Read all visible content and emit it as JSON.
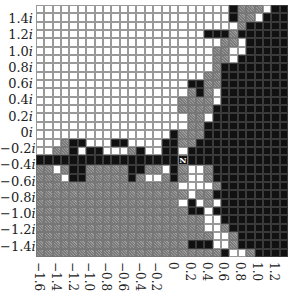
{
  "chart_data": {
    "type": "heatmap",
    "title": "",
    "xlabel": "",
    "ylabel": "",
    "x_ticks": [
      "-1.6",
      "-1.4",
      "-1.2",
      "-1.0",
      "-0.8",
      "-0.6",
      "-0.4",
      "-0.2",
      "0",
      "0.2",
      "0.4",
      "0.6",
      "0.8",
      "1.0",
      "1.2"
    ],
    "y_ticks": [
      "1.4i",
      "1.2i",
      "1.0i",
      "0.8i",
      "0.6i",
      "0.4i",
      "0.2i",
      "0i",
      "-0.2i",
      "-0.4i",
      "-0.6i",
      "-0.8i",
      "-1.0i",
      "-1.2i",
      "-1.4i"
    ],
    "xlim": [
      -1.6,
      1.4
    ],
    "ylim": [
      -1.5,
      1.5
    ],
    "grid": true,
    "legend": {
      "W": "white cell",
      "G": "gray (checkered) cell",
      "B": "black cell",
      "N": "marker cell labeled N"
    },
    "marker_label": "N",
    "rows": [
      "WWWWWWWWWWWWWWWWWWWWWWWBGGGWBB",
      "WWWWWWWWWWWWWWWWWWWWWWWBGGWBBB",
      "WWWWWWWWWWWWWWWWWWWWWWWWGBBBBB",
      "WWWWWWWWWWWWWWWWWWWWBBBGBBBBBB",
      "WWWWWWWWWWWWWWWWWWWWWWGGWBBBBB",
      "WWWWWWWWWWWWWWWWWWWWWGGWWBBBBB",
      "WWWWWWWWWWWWWWWWWWWWWGGWBBBBBB",
      "WWWWWWWWWWWWWWWWWWWWWGBBBBBBBB",
      "WWWWWWWWWWWWWWWWWWWWGGBBBBBBBB",
      "WWWWWWWWWWWWWWWWWWBBGGBBBBBBBB",
      "WWWWWWWWWWWWWWWWWWGBGWBBBBBBBB",
      "WWWWWWWWWWWWWWWWWGGGGWBBBBBBBB",
      "WWWWWWWWWWWWWWWWWGGGGBBBBBBBBB",
      "WWWWWWWWWWWWWWWWWWGGWBBBBBBBBB",
      "WWWWWWWWWWWWWWWWWWGGBBBBBBBBBB",
      "WWWWWWWWWWWWWWWWBGGGBBBBBBBBBB",
      "WWWGBBWWWBBWWWWBBGGBBBBBBBBBBB",
      "WWGGBWBBWWWGBWWBBWBBBBBBBBBBBB",
      "BBBBBBBBBBBBBBBBBNBBBBBBBBBBBB",
      "GGWGBBGGGGGBBGGWBGWWGBBBBBBBBB",
      "GGGWBBGGGGGBGWWGBGWWGBBBBBBBBB",
      "GGGGGGGGGGGGGGGGGWWWWGBBBBBBBB",
      "GGGGGGGGGGGGGGGGGGWGGBBBBBBBBB",
      "GGGGGGGGGGGGGGGGGWBWGWBBBBBBBB",
      "GGGGGGGGGGGGGGGGGGBBWBBBBBBBBB",
      "GGGGGGGGGGGGGGGGGGGGWWBBBBBBBB",
      "GGGGGGGGGGGGGGGGGGGGWWGBBBBBBB",
      "GGGGGGGGGGGGGGGGGGGGGWWGBBBBBB",
      "GGGGGGGGGGGGGGGGGGBBBWWGBBBBBB",
      "GGGGGGGGGGGGGGGGGGGGGGBWWGBBBB"
    ]
  }
}
